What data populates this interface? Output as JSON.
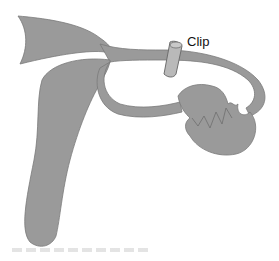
{
  "diagram": {
    "type": "anatomical illustration",
    "labels": [
      {
        "id": "clip",
        "text": "Clip"
      }
    ],
    "colors": {
      "tissue": "#9a9a9a",
      "tissue_outline": "#7a7a7a",
      "clip": "#b9b9b9",
      "clip_outline": "#6e6e6e",
      "background": "#ffffff"
    }
  }
}
